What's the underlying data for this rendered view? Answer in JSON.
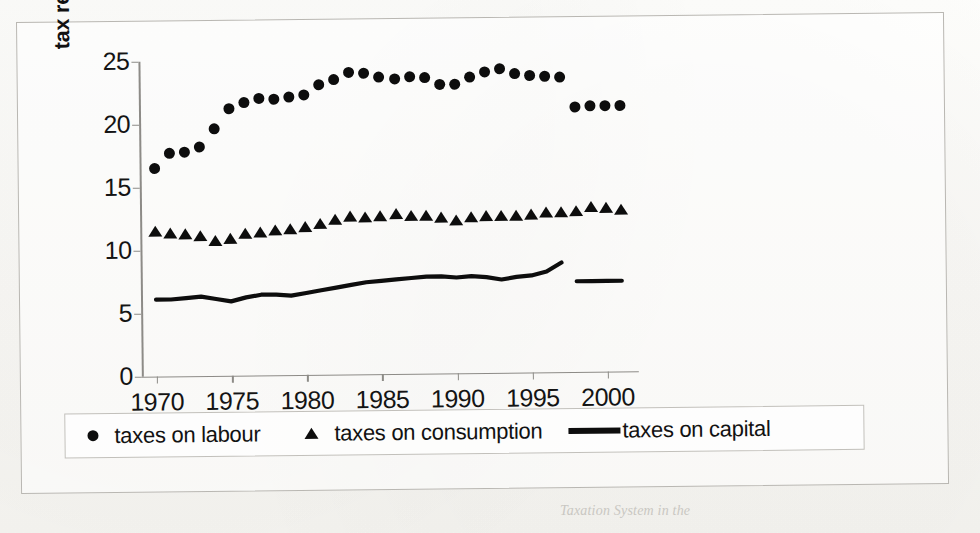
{
  "figure": {
    "y_axis_title": "tax revenues (% GDP)",
    "caption_fragment": "Taxation System in the"
  },
  "legend": {
    "entries": [
      {
        "label": "taxes on labour",
        "marker": "dot"
      },
      {
        "label": "taxes on consumption",
        "marker": "triangle"
      },
      {
        "label": "taxes on capital",
        "marker": "line"
      }
    ]
  },
  "chart_data": {
    "type": "scatter",
    "title": "",
    "xlabel": "",
    "ylabel": "tax revenues (% GDP)",
    "xlim": [
      1969,
      2002
    ],
    "ylim": [
      0,
      25
    ],
    "xticks": [
      1970,
      1975,
      1980,
      1985,
      1990,
      1995,
      2000
    ],
    "yticks": [
      0,
      5,
      10,
      15,
      20,
      25
    ],
    "grid": false,
    "legend_position": "bottom",
    "marker_color": "#0d0d0d",
    "axis_color": "#8d8b87",
    "note": "labour and capital series break between 1997 and 1998 (series discontinuity)",
    "series": [
      {
        "name": "taxes on labour",
        "marker": "dot",
        "x": [
          1970,
          1971,
          1972,
          1973,
          1974,
          1975,
          1976,
          1977,
          1978,
          1979,
          1980,
          1981,
          1982,
          1983,
          1984,
          1985,
          1986,
          1987,
          1988,
          1989,
          1990,
          1991,
          1992,
          1993,
          1994,
          1995,
          1996,
          1997,
          1998,
          1999,
          2000,
          2001
        ],
        "values": [
          16.5,
          17.7,
          17.8,
          18.2,
          19.6,
          21.2,
          21.7,
          22.0,
          21.9,
          22.1,
          22.2,
          23.0,
          23.4,
          24.0,
          23.9,
          23.6,
          23.4,
          23.6,
          23.5,
          22.9,
          22.9,
          23.5,
          23.9,
          24.1,
          23.7,
          23.6,
          23.5,
          23.4,
          21.0,
          21.1,
          21.1,
          21.1
        ]
      },
      {
        "name": "taxes on consumption",
        "marker": "triangle",
        "x": [
          1970,
          1971,
          1972,
          1973,
          1974,
          1975,
          1976,
          1977,
          1978,
          1979,
          1980,
          1981,
          1982,
          1983,
          1984,
          1985,
          1986,
          1987,
          1988,
          1989,
          1990,
          1991,
          1992,
          1993,
          1994,
          1995,
          1996,
          1997,
          1998,
          1999,
          2000,
          2001
        ],
        "values": [
          11.4,
          11.3,
          11.2,
          11.0,
          10.6,
          10.8,
          11.2,
          11.3,
          11.4,
          11.5,
          11.7,
          11.9,
          12.2,
          12.5,
          12.4,
          12.5,
          12.6,
          12.5,
          12.5,
          12.3,
          12.1,
          12.3,
          12.4,
          12.4,
          12.4,
          12.5,
          12.6,
          12.6,
          12.7,
          13.0,
          12.9,
          12.8
        ]
      },
      {
        "name": "taxes on capital",
        "marker": "line",
        "segments": [
          {
            "x": [
              1970,
              1971,
              1972,
              1973,
              1974,
              1975,
              1976,
              1977,
              1978,
              1979,
              1980,
              1981,
              1982,
              1983,
              1984,
              1985,
              1986,
              1987,
              1988,
              1989,
              1990,
              1991,
              1992,
              1993,
              1994,
              1995,
              1996,
              1997
            ],
            "values": [
              6.1,
              6.1,
              6.2,
              6.3,
              6.1,
              5.9,
              6.2,
              6.4,
              6.4,
              6.3,
              6.5,
              6.7,
              6.9,
              7.1,
              7.3,
              7.4,
              7.5,
              7.6,
              7.7,
              7.7,
              7.6,
              7.7,
              7.6,
              7.4,
              7.6,
              7.7,
              8.0,
              8.7
            ]
          },
          {
            "x": [
              1998,
              1999,
              2000,
              2001
            ],
            "values": [
              7.2,
              7.2,
              7.2,
              7.2
            ]
          }
        ]
      }
    ]
  }
}
